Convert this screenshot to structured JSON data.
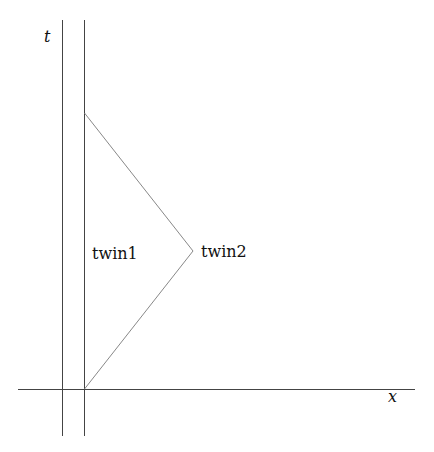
{
  "diagram": {
    "axes": {
      "t_label": "t",
      "x_label": "x"
    },
    "worldlines": [
      {
        "name": "t-axis",
        "from": [
          62,
          20
        ],
        "to": [
          62,
          436
        ]
      },
      {
        "name": "twin1",
        "from": [
          84,
          20
        ],
        "to": [
          84,
          436
        ]
      },
      {
        "name": "twin2-outbound",
        "from": [
          84,
          389
        ],
        "to": [
          193,
          251
        ]
      },
      {
        "name": "twin2-return",
        "from": [
          193,
          251
        ],
        "to": [
          84,
          113
        ]
      }
    ],
    "x_axis": {
      "from": [
        18,
        389
      ],
      "to": [
        415,
        389
      ]
    },
    "labels": {
      "twin1": "twin1",
      "twin2": "twin2"
    },
    "colors": {
      "axis": "#444444",
      "worldline": "#888888"
    }
  }
}
